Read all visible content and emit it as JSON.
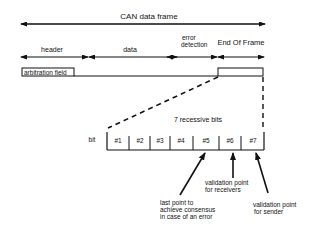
{
  "title": "CAN data frame",
  "segments": [
    {
      "label": "header"
    },
    {
      "label": "data"
    },
    {
      "label": "error",
      "label2": "detection"
    },
    {
      "label": "End Of Frame"
    }
  ],
  "arbitration_label": "arbitration field",
  "recessive_label": "7 recessive bits",
  "bit_label": "bit",
  "bits": [
    "#1",
    "#2",
    "#3",
    "#4",
    "#5",
    "#6",
    "#7"
  ],
  "annotations": {
    "bit5": [
      "last point  to",
      "achieve consensus",
      "in case of an error"
    ],
    "bit6": [
      "validation point",
      "for receivers"
    ],
    "bit7": [
      "validation point",
      "for sender"
    ]
  },
  "colors": {
    "ink": "#111111",
    "background": "#ffffff"
  }
}
